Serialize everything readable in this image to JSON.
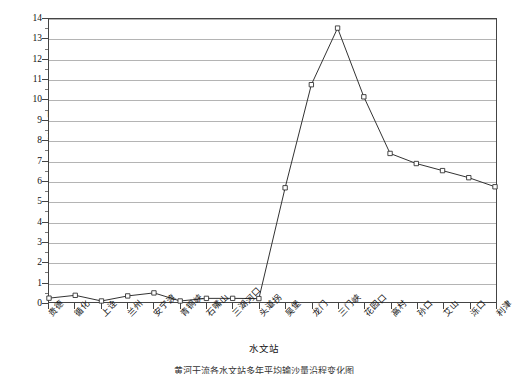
{
  "chart_data": {
    "type": "line",
    "title": "",
    "xlabel": "水文站",
    "ylabel": "输沙量/10⁸t",
    "ylim": [
      0,
      14
    ],
    "ytick_step": 1,
    "grid": true,
    "legend": "none",
    "marker": "open-square",
    "line_color": "#333333",
    "grid_color": "#b4b4b4",
    "axis_color": "#444444",
    "categories": [
      "贵德",
      "循化",
      "上诠",
      "兰州",
      "安宁渡",
      "青铜峡",
      "石嘴山",
      "三湖河口",
      "头道拐",
      "吴堡",
      "龙门",
      "三门峡",
      "花园口",
      "高村",
      "孙口",
      "艾山",
      "泺口",
      "利津"
    ],
    "values": [
      0.19,
      0.33,
      0.05,
      0.3,
      0.45,
      0.05,
      0.18,
      0.18,
      0.17,
      5.65,
      10.75,
      13.55,
      10.15,
      7.35,
      6.85,
      6.5,
      6.15,
      5.7
    ],
    "ytick_labels": [
      "0",
      "1",
      "2",
      "3",
      "4",
      "5",
      "6",
      "7",
      "8",
      "9",
      "10",
      "11",
      "12",
      "13",
      "14"
    ]
  },
  "axes": {
    "y_title": "输沙量/10⁸t",
    "x_title": "水文站"
  },
  "caption": {
    "text": "黄河干流各水文站多年平均输沙量沿程变化图"
  }
}
